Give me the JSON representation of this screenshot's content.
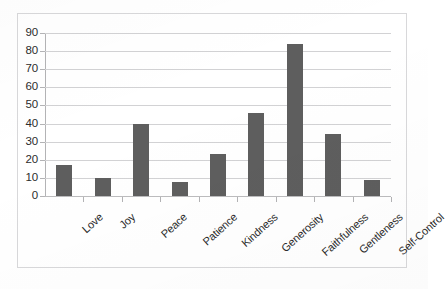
{
  "chart_data": {
    "type": "bar",
    "title": "",
    "subtitle": "",
    "xlabel": "",
    "ylabel": "",
    "categories": [
      "Love",
      "Joy",
      "Peace",
      "Patience",
      "Kindness",
      "Generosity",
      "Faithfulness",
      "Gentleness",
      "Self-Control"
    ],
    "values": [
      17,
      10,
      40,
      8,
      23,
      46,
      84,
      34,
      9
    ],
    "series": [
      {
        "name": "Series 1",
        "values": [
          17,
          10,
          40,
          8,
          23,
          46,
          84,
          34,
          9
        ]
      }
    ],
    "ylim": [
      0,
      90
    ],
    "ytick_labels": [
      "90",
      "80",
      "70",
      "60",
      "50",
      "40",
      "30",
      "20",
      "10",
      "0"
    ],
    "ytick_values": [
      90,
      80,
      70,
      60,
      50,
      40,
      30,
      20,
      10,
      0
    ],
    "ytick_step": 10,
    "grid": true,
    "grid_axis": "y",
    "legend": false,
    "legend_position": "none",
    "annotations": [],
    "bar_color": "#5e5e5e",
    "gridline_color": "#d2d2d4",
    "axis_color": "#b3b3b5",
    "plot_background": "#ffffff",
    "frame_color": "#d8d8da",
    "category_label_rotation": -42
  }
}
